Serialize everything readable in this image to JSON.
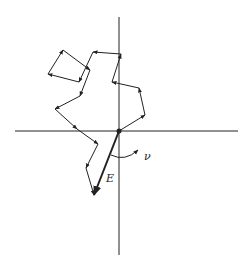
{
  "diagram": {
    "type": "phasor random walk",
    "colors": {
      "line": "#222222",
      "background": "#ffffff"
    },
    "origin": [
      119,
      131
    ],
    "axes": {
      "horizontal": {
        "x1": 15,
        "x2": 238,
        "y": 131
      },
      "vertical": {
        "x": 119,
        "y1": 17,
        "y2": 255
      }
    },
    "walk_points": [
      [
        119,
        131
      ],
      [
        145,
        115
      ],
      [
        139,
        88
      ],
      [
        112,
        82
      ],
      [
        121,
        54
      ],
      [
        93,
        52
      ],
      [
        79,
        82
      ],
      [
        48,
        74
      ],
      [
        63,
        50
      ],
      [
        90,
        70
      ],
      [
        80,
        96
      ],
      [
        55,
        109
      ],
      [
        77,
        129
      ],
      [
        98,
        144
      ],
      [
        86,
        168
      ],
      [
        94,
        195
      ]
    ],
    "resultant": {
      "from": [
        119,
        131
      ],
      "to": [
        94,
        195
      ],
      "label": "E"
    },
    "angle_arc": {
      "label": "ν"
    },
    "labels": {
      "resultant": "E",
      "angle": "ν"
    }
  }
}
